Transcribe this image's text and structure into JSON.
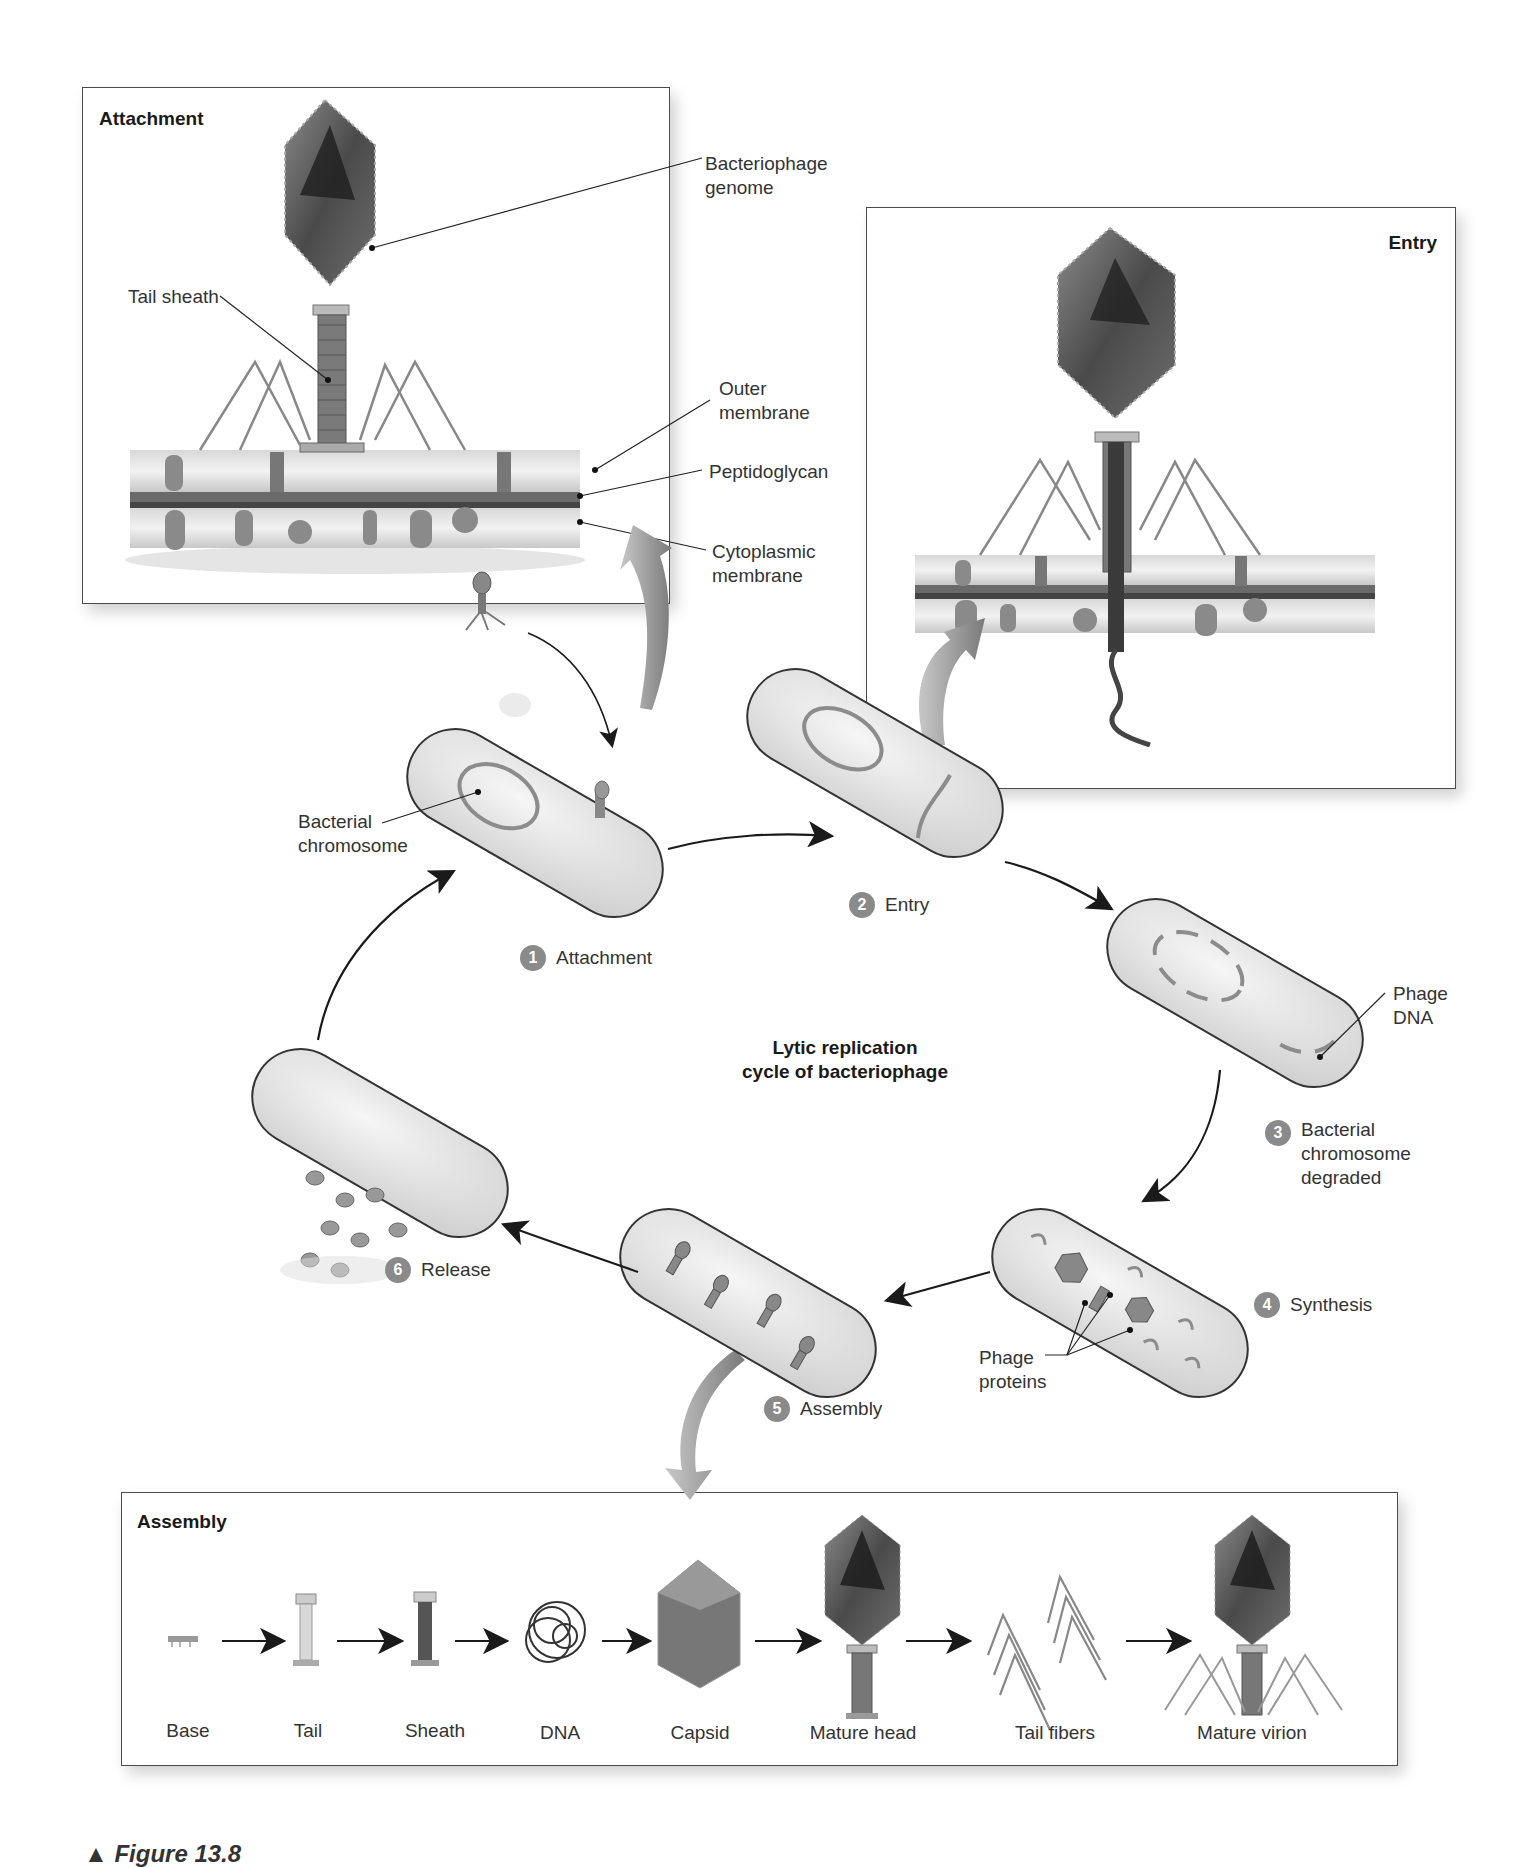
{
  "diagram": {
    "title": "Lytic replication cycle of bacteriophage",
    "title_lines": [
      "Lytic replication",
      "cycle of bacteriophage"
    ],
    "panels": {
      "attachment": {
        "title": "Attachment",
        "labels": {
          "genome": "Bacteriophage\ngenome",
          "tail_sheath": "Tail sheath",
          "outer_membrane": "Outer\nmembrane",
          "peptidoglycan": "Peptidoglycan",
          "cytoplasmic_membrane": "Cytoplasmic\nmembrane"
        }
      },
      "entry": {
        "title": "Entry"
      },
      "assembly": {
        "title": "Assembly",
        "components": [
          "Base",
          "Tail",
          "Sheath",
          "DNA",
          "Capsid",
          "Mature head",
          "Tail fibers",
          "Mature virion"
        ]
      }
    },
    "steps": [
      {
        "number": "1",
        "label": "Attachment"
      },
      {
        "number": "2",
        "label": "Entry"
      },
      {
        "number": "3",
        "label": "Bacterial\nchromosome\ndegraded"
      },
      {
        "number": "4",
        "label": "Synthesis"
      },
      {
        "number": "5",
        "label": "Assembly"
      },
      {
        "number": "6",
        "label": "Release"
      }
    ],
    "callouts": {
      "bacterial_chromosome": "Bacterial\nchromosome",
      "phage_dna": "Phage\nDNA",
      "phage_proteins": "Phage\nproteins"
    },
    "caption_fragment": "Figure 13.8"
  },
  "colors": {
    "badge": "#8a8a8a",
    "cell_fill": "#eeeeee",
    "chromosome": "#8c8c8c",
    "phage_dark": "#555555",
    "arrow": "#1a1a1a"
  }
}
